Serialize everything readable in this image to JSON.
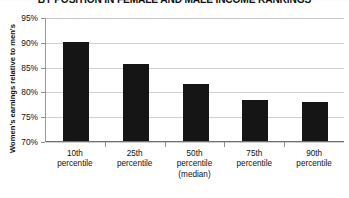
{
  "chart_data": {
    "type": "bar",
    "title": "BY POSITION IN FEMALE AND MALE INCOME RANKINGS",
    "xlabel": "",
    "ylabel": "Women's earnings relative to men's",
    "categories": [
      "10th percentile",
      "25th percentile",
      "50th percentile (median)",
      "75th percentile",
      "90th percentile"
    ],
    "category_lines": [
      [
        "10th",
        "percentile"
      ],
      [
        "25th",
        "percentile"
      ],
      [
        "50th",
        "percentile",
        "(median)"
      ],
      [
        "75th",
        "percentile"
      ],
      [
        "90th",
        "percentile"
      ]
    ],
    "values": [
      90.0,
      85.5,
      81.5,
      78.3,
      77.8
    ],
    "value_labels": [
      "90%",
      "85.5%",
      "81.5%",
      "78.3%",
      "77.8%"
    ],
    "ylim": [
      70,
      95
    ],
    "ytick_values": [
      95,
      90,
      85,
      80,
      75,
      70
    ],
    "ytick_labels": [
      "95%",
      "90%",
      "85%",
      "80%",
      "75%",
      "70%"
    ],
    "grid": true,
    "legend": false,
    "bar_color": "#151515",
    "gridline_color": "#cfcfcf",
    "axis_color": "#6e6e6e",
    "background_color": "#ffffff",
    "units": "percent"
  }
}
